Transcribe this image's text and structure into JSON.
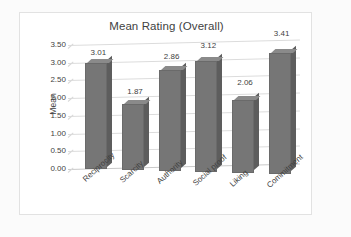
{
  "chart_data": {
    "type": "bar",
    "title": "Mean Rating (Overall)",
    "xlabel": "",
    "ylabel": "Mean",
    "categories": [
      "Reciprocity",
      "Scarcity",
      "Authority",
      "Social proof",
      "Liking",
      "Commitment"
    ],
    "values": [
      3.01,
      1.87,
      2.86,
      3.12,
      2.06,
      3.41
    ],
    "value_labels": [
      "3.01",
      "1.87",
      "2.86",
      "3.12",
      "2.06",
      "3.41"
    ],
    "ylim": [
      0.0,
      3.5
    ],
    "ytick_labels": [
      "3.50",
      "3.00",
      "2.50",
      "2.00",
      "1.50",
      "1.00",
      "0.50",
      "0.00"
    ],
    "ytick_values": [
      3.5,
      3.0,
      2.5,
      2.0,
      1.5,
      1.0,
      0.5,
      0.0
    ],
    "grid": true,
    "legend": false,
    "legend_position": "none",
    "style": "3d-column",
    "colors": {
      "bar_front": "#767676",
      "bar_side": "#5d5d5d",
      "bar_top": "#8a8a8a",
      "gridline": "#dcdcdc",
      "text": "#3f3f3f",
      "plot_background": "#ffffff",
      "frame_border": "#e2e2e2",
      "page_background": "#fbfbfb"
    }
  }
}
